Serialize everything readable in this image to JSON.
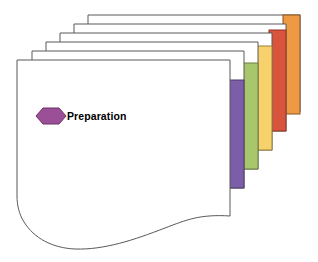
{
  "diagram": {
    "type": "stacked-cards-phase-diagram",
    "title": "Preparation",
    "background_color": "#ffffff",
    "card_fill": "#ffffff",
    "card_stroke": "#595959",
    "front_card": {
      "label": "Preparation",
      "label_color": "#000000",
      "icon": "hexagon-icon",
      "icon_fill": "#9B4F96",
      "icon_stroke": "#6E2E69",
      "bottom_edge": "wavy-torn"
    },
    "layers": [
      {
        "index": 0,
        "name": "layer-6-back",
        "tab_color": "#EE9944",
        "tab_stroke": "#8A5520",
        "left": 88,
        "top": 15,
        "tab_label": ""
      },
      {
        "index": 1,
        "name": "layer-5",
        "tab_color": "#D9543C",
        "tab_stroke": "#8C3526",
        "left": 74,
        "top": 24,
        "tab_label": ""
      },
      {
        "index": 2,
        "name": "layer-4",
        "tab_color": "#F7D16B",
        "tab_stroke": "#9A8038",
        "left": 60,
        "top": 33,
        "tab_label": ""
      },
      {
        "index": 3,
        "name": "layer-3",
        "tab_color": "#A8C66C",
        "tab_stroke": "#6B8040",
        "left": 46,
        "top": 42,
        "tab_label": ""
      },
      {
        "index": 4,
        "name": "layer-2",
        "tab_color": "#7B5EA7",
        "tab_stroke": "#4E3B6B",
        "left": 32,
        "top": 51,
        "tab_label": ""
      },
      {
        "index": 5,
        "name": "layer-1-front",
        "tab_color": "#ffffff",
        "tab_stroke": "#595959",
        "left": 17,
        "top": 60,
        "tab_label": ""
      }
    ],
    "colors": {
      "purple": "#7B5EA7",
      "green": "#A8C66C",
      "yellow": "#F7D16B",
      "red": "#D9543C",
      "orange": "#EE9944",
      "hexagon_purple": "#9B4F96",
      "outline": "#595959"
    }
  }
}
